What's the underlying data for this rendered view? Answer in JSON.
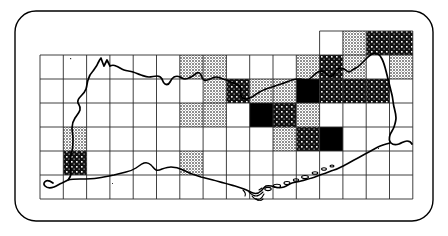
{
  "figure": {
    "type": "distribution-map",
    "border": {
      "shape": "rounded-rectangle",
      "corner_radius_px": 22,
      "stroke_color": "#000000",
      "stroke_width_px": 1.4,
      "fill_color": "#ffffff",
      "x": 14,
      "y": 10,
      "width": 420,
      "height": 212
    }
  },
  "grid": {
    "origin_x": 40,
    "origin_y": 55,
    "cell_width": 23.3,
    "cell_height": 24.0,
    "columns": 16,
    "rows": 6,
    "line_color": "#2b2b2b",
    "line_width_px": 0.9,
    "extension_row": {
      "present": true,
      "label": "top-right extension",
      "start_column": 12,
      "columns": 4,
      "y_offset_rows": -1
    }
  },
  "symbols": {
    "blank": {
      "key": "blank",
      "label": "no record",
      "fill": "#ffffff",
      "pattern": "none"
    },
    "light": {
      "key": "light",
      "label": "light stipple",
      "fill": "#a8a8a8",
      "pattern": "fine-stipple"
    },
    "hatch": {
      "key": "hatch",
      "label": "dark cross-hatch with dots",
      "fill": "#1a1a1a",
      "pattern": "crosshatch-dot"
    },
    "solid": {
      "key": "solid",
      "label": "solid black",
      "fill": "#000000",
      "pattern": "solid"
    }
  },
  "chart_data": {
    "type": "heatmap",
    "title": "",
    "xlabel": "",
    "ylabel": "",
    "legend_position": "none",
    "grid": true,
    "categories": [
      "c1",
      "c2",
      "c3",
      "c4",
      "c5",
      "c6",
      "c7",
      "c8",
      "c9",
      "c10",
      "c11",
      "c12",
      "c13",
      "c14",
      "c15",
      "c16"
    ],
    "row_labels": [
      "r0",
      "r1",
      "r2",
      "r3",
      "r4",
      "r5",
      "r6"
    ],
    "value_scale": [
      "blank",
      "light",
      "hatch",
      "solid"
    ],
    "cells": [
      {
        "row": 0,
        "col": 12,
        "value": "blank"
      },
      {
        "row": 0,
        "col": 13,
        "value": "light"
      },
      {
        "row": 0,
        "col": 14,
        "value": "hatch"
      },
      {
        "row": 0,
        "col": 15,
        "value": "hatch"
      },
      {
        "row": 1,
        "col": 1,
        "value": "blank"
      },
      {
        "row": 1,
        "col": 2,
        "value": "blank"
      },
      {
        "row": 1,
        "col": 3,
        "value": "blank"
      },
      {
        "row": 1,
        "col": 4,
        "value": "blank"
      },
      {
        "row": 1,
        "col": 5,
        "value": "blank"
      },
      {
        "row": 1,
        "col": 6,
        "value": "light"
      },
      {
        "row": 1,
        "col": 7,
        "value": "light"
      },
      {
        "row": 1,
        "col": 11,
        "value": "light"
      },
      {
        "row": 1,
        "col": 12,
        "value": "hatch"
      },
      {
        "row": 1,
        "col": 13,
        "value": "light"
      },
      {
        "row": 1,
        "col": 15,
        "value": "light"
      },
      {
        "row": 2,
        "col": 7,
        "value": "light"
      },
      {
        "row": 2,
        "col": 8,
        "value": "hatch"
      },
      {
        "row": 2,
        "col": 9,
        "value": "light"
      },
      {
        "row": 2,
        "col": 10,
        "value": "light"
      },
      {
        "row": 2,
        "col": 11,
        "value": "solid"
      },
      {
        "row": 2,
        "col": 12,
        "value": "hatch"
      },
      {
        "row": 2,
        "col": 13,
        "value": "hatch"
      },
      {
        "row": 2,
        "col": 14,
        "value": "hatch"
      },
      {
        "row": 3,
        "col": 6,
        "value": "light"
      },
      {
        "row": 3,
        "col": 7,
        "value": "light"
      },
      {
        "row": 3,
        "col": 9,
        "value": "solid"
      },
      {
        "row": 3,
        "col": 10,
        "value": "hatch"
      },
      {
        "row": 3,
        "col": 11,
        "value": "light"
      },
      {
        "row": 4,
        "col": 1,
        "value": "light"
      },
      {
        "row": 4,
        "col": 10,
        "value": "light"
      },
      {
        "row": 4,
        "col": 11,
        "value": "hatch"
      },
      {
        "row": 4,
        "col": 12,
        "value": "solid"
      },
      {
        "row": 5,
        "col": 1,
        "value": "hatch"
      },
      {
        "row": 5,
        "col": 6,
        "value": "light"
      },
      {
        "row": 6,
        "col": 0,
        "value": "blank"
      }
    ],
    "counts": {
      "blank": 87,
      "light": 18,
      "hatch": 12,
      "solid": 4
    }
  },
  "coastline": {
    "stroke_color": "#000000",
    "stroke_width_px": 1.6,
    "label": "coastline outline of landmass"
  }
}
